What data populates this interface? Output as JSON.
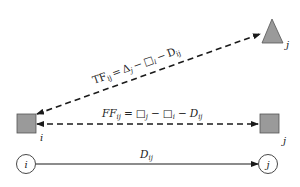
{
  "diagram": {
    "colors": {
      "node_fill": "#9a9a9a",
      "node_stroke": "#555555",
      "line": "#1a1a1a",
      "background": "#ffffff"
    },
    "nodes": {
      "triangle_j": {
        "label": "j"
      },
      "square_i": {
        "label": "i"
      },
      "square_j": {
        "label": "j"
      },
      "circle_i": {
        "label": "i"
      },
      "circle_j": {
        "label": "j"
      }
    },
    "edges": {
      "total_float": {
        "lhs": "TF",
        "lhs_sub": "ij",
        "eq": "=",
        "t1": "Δ",
        "t1_sub": "j",
        "minus1": "−",
        "t2": "□",
        "t2_sub": "i",
        "minus2": "−",
        "t3": "D",
        "t3_sub": "ij"
      },
      "free_float": {
        "lhs": "FF",
        "lhs_sub": "ij",
        "eq": "=",
        "t1": "□",
        "t1_sub": "j",
        "minus1": "−",
        "t2": "□",
        "t2_sub": "i",
        "minus2": "−",
        "t3": "D",
        "t3_sub": "ij"
      },
      "duration": {
        "label": "D",
        "label_sub": "ij"
      }
    }
  }
}
